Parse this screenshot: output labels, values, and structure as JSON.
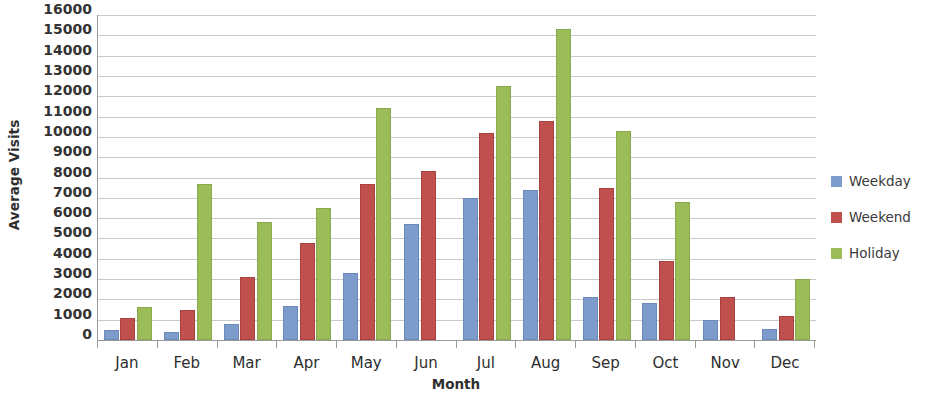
{
  "chart_data": {
    "type": "bar",
    "title": "",
    "xlabel": "Month",
    "ylabel": "Average Visits",
    "categories": [
      "Jan",
      "Feb",
      "Mar",
      "Apr",
      "May",
      "Jun",
      "Jul",
      "Aug",
      "Sep",
      "Oct",
      "Nov",
      "Dec"
    ],
    "series": [
      {
        "name": "Weekday",
        "color": "#7e9ccb",
        "values": [
          400,
          300,
          700,
          1600,
          3200,
          5600,
          6900,
          7300,
          2000,
          1700,
          900,
          450
        ]
      },
      {
        "name": "Weekend",
        "color": "#c0504d",
        "values": [
          1000,
          1400,
          3000,
          4700,
          7600,
          8200,
          10100,
          10700,
          7400,
          3800,
          2000,
          1100
        ]
      },
      {
        "name": "Holiday",
        "color": "#9cbb59",
        "values": [
          1550,
          7600,
          5700,
          6400,
          11300,
          0,
          12400,
          15200,
          10200,
          6700,
          0,
          2900
        ]
      }
    ],
    "ylim": [
      0,
      16000
    ],
    "ytick_step": 1000,
    "yticks": [
      0,
      1000,
      2000,
      3000,
      4000,
      5000,
      6000,
      7000,
      8000,
      9000,
      10000,
      11000,
      12000,
      13000,
      14000,
      15000,
      16000
    ],
    "ytick_labels": [
      "0",
      "1000",
      "2000",
      "3000",
      "4000",
      "5000",
      "6000",
      "7000",
      "8000",
      "9000",
      "10000",
      "11000",
      "12000",
      "13000",
      "14000",
      "15000",
      "16000"
    ],
    "grid": true,
    "legend_position": "right"
  }
}
